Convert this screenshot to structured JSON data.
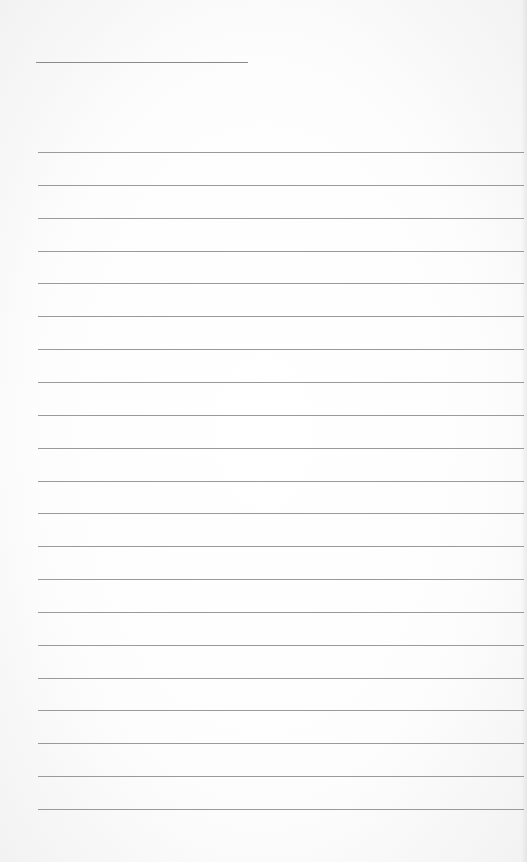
{
  "paper": {
    "type": "lined-notepaper",
    "background_color": "#fdfdfd",
    "line_color": "#9a9a9a",
    "title_line": {
      "x": 36,
      "y": 62,
      "width": 212
    },
    "rules": {
      "count": 21,
      "start_y": 152,
      "spacing": 32.85,
      "x": 38,
      "width": 486
    }
  }
}
